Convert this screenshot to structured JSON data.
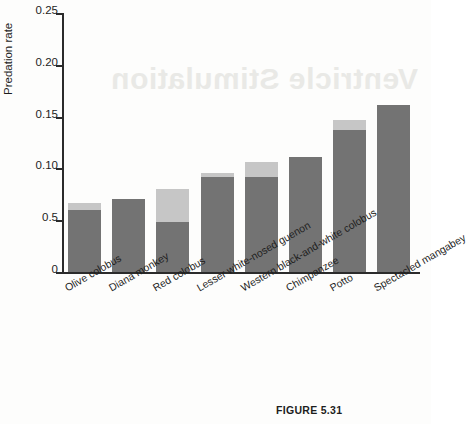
{
  "figure": {
    "caption": "FIGURE 5.31",
    "bleed_through_text": "Ventricle Stimulation"
  },
  "chart_data": {
    "type": "bar",
    "title": "",
    "xlabel": "",
    "ylabel": "Predation rate",
    "ylim": [
      0,
      0.25
    ],
    "grid": false,
    "legend": "none",
    "stacked": true,
    "y_ticks": [
      {
        "value": 0,
        "label": "0"
      },
      {
        "value": 0.05,
        "label": "0.5"
      },
      {
        "value": 0.1,
        "label": "0.10"
      },
      {
        "value": 0.15,
        "label": "0.15"
      },
      {
        "value": 0.2,
        "label": "0.20"
      },
      {
        "value": 0.25,
        "label": "0.25"
      }
    ],
    "categories": [
      "Olive colobus",
      "Diana monkey",
      "Red colobus",
      "Lesser white-nosed guenon",
      "Western black-and-white colobus",
      "Chimpanzee",
      "Potto",
      "Spectacled mangabey"
    ],
    "series": [
      {
        "name": "lower segment",
        "color": "#737373",
        "values": [
          0.06,
          0.07,
          0.048,
          0.092,
          0.092,
          0.111,
          0.137,
          0.161
        ]
      },
      {
        "name": "upper segment",
        "color": "#c6c6c6",
        "values": [
          0.007,
          0.0,
          0.032,
          0.004,
          0.014,
          0.0,
          0.01,
          0.0
        ]
      }
    ],
    "totals": [
      0.067,
      0.07,
      0.08,
      0.096,
      0.106,
      0.111,
      0.147,
      0.161
    ]
  },
  "colors": {
    "dark_segment": "#737373",
    "light_segment": "#c6c6c6",
    "axis": "#2b2b2b",
    "background": "#fdfdfc"
  }
}
